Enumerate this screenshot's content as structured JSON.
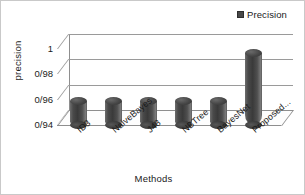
{
  "chart_data": {
    "type": "bar",
    "title": "",
    "xlabel": "Methods",
    "ylabel": "precision",
    "categories": [
      "ID3",
      "NaiveBayes",
      "J48",
      "NBTree",
      "BayesNet",
      "Proposed..."
    ],
    "values": [
      0.962,
      0.962,
      0.962,
      0.962,
      0.962,
      1.0
    ],
    "series": [
      {
        "name": "Precision",
        "values": [
          0.962,
          0.962,
          0.962,
          0.962,
          0.962,
          1.0
        ]
      }
    ],
    "ylim": [
      0.94,
      1.0
    ],
    "ytick_labels": [
      "1",
      "0/98",
      "0/96",
      "0/94"
    ],
    "ytick_values": [
      1.0,
      0.98,
      0.96,
      0.94
    ],
    "grid": true,
    "legend": {
      "position": "top-right",
      "entries": [
        "Precision"
      ]
    },
    "style": "3d-cylinder",
    "bar_color": "#4a4a4a",
    "gridline_color": "#9a9a9a",
    "axis_color": "#8e8e8e",
    "background_color": "#ffffff",
    "border_color": "#c9c9c9"
  },
  "legend": {
    "label": "Precision"
  },
  "axes": {
    "y_title": "precision",
    "x_title": "Methods"
  }
}
